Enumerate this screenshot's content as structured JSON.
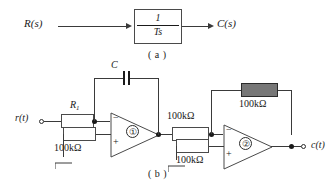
{
  "figure": {
    "part_a": {
      "caption": "( a )",
      "input_label": "R(s)",
      "output_label": "C(s)",
      "block": {
        "numerator": "1",
        "denominator": "Ts"
      }
    },
    "part_b": {
      "caption": "( b )",
      "input_label": "r(t)",
      "output_label": "c(t)",
      "capacitor_label": "C",
      "r1_label": "R",
      "r1_subscript": "1",
      "stage1_number": "①",
      "stage2_number": "②",
      "resistors": {
        "stage1_plus_to_ground": "100kΩ",
        "interstage_series": "100kΩ",
        "stage2_feedback": "100kΩ",
        "stage2_plus_to_ground": "100kΩ"
      },
      "opamp_minus": "−",
      "opamp_plus": "+"
    }
  },
  "colors": {
    "line": "#3a3a3a",
    "text": "#1a1a1a",
    "dark_resistor": "#777777"
  }
}
